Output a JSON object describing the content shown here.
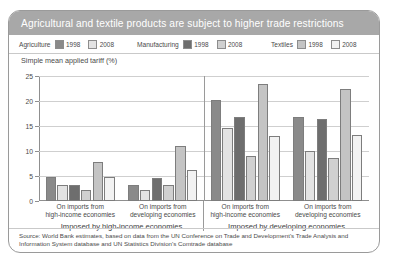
{
  "title": "Agricultural and textile products are subject to higher trade restrictions",
  "legend": [
    {
      "name": "Agriculture",
      "items": [
        {
          "label": "1998",
          "color": "#8a8a8a"
        },
        {
          "label": "2008",
          "color": "#e3e3e3"
        }
      ]
    },
    {
      "name": "Manufacturing",
      "items": [
        {
          "label": "1998",
          "color": "#6e6e6e"
        },
        {
          "label": "2008",
          "color": "#d0d0d0"
        }
      ]
    },
    {
      "name": "Textiles",
      "items": [
        {
          "label": "1998",
          "color": "#c4c4c4"
        },
        {
          "label": "2008",
          "color": "#f2f2f2"
        }
      ]
    }
  ],
  "axis_title": "Simple mean applied tariff (%)",
  "source": "Source: World Bank estimates, based on data from the UN Conference on Trade and Development's Trade Analysis and Information System database and UN Statistics Division's Comtrade database",
  "group_labels": [
    "Imposed by high-income economies",
    "Imposed by developing economies"
  ],
  "chart_data": {
    "type": "bar",
    "title": "Agricultural and textile products are subject to higher trade restrictions",
    "xlabel": "",
    "ylabel": "Simple mean applied tariff (%)",
    "ylim": [
      0,
      25
    ],
    "yticks": [
      0,
      5,
      10,
      15,
      20,
      25
    ],
    "grid": true,
    "legend_position": "top",
    "categories": [
      "On imports from high-income economies",
      "On imports from developing economies",
      "On imports from high-income economies",
      "On imports from developing economies"
    ],
    "category_lines": [
      [
        "On imports from",
        "high-income economies"
      ],
      [
        "On imports from",
        "developing economies"
      ],
      [
        "On imports from",
        "high-income economies"
      ],
      [
        "On imports from",
        "developing economies"
      ]
    ],
    "panels": [
      {
        "label": "Imposed by high-income economies",
        "categories": [
          0,
          1
        ]
      },
      {
        "label": "Imposed by developing economies",
        "categories": [
          2,
          3
        ]
      }
    ],
    "series": [
      {
        "name": "Agriculture 1998",
        "color": "#8a8a8a",
        "values": [
          4.8,
          3.3,
          20.3,
          16.8
        ]
      },
      {
        "name": "Agriculture 2008",
        "color": "#e3e3e3",
        "values": [
          3.2,
          2.3,
          14.6,
          10.0
        ]
      },
      {
        "name": "Manufacturing 1998",
        "color": "#6e6e6e",
        "values": [
          3.3,
          4.6,
          16.8,
          16.5
        ]
      },
      {
        "name": "Manufacturing 2008",
        "color": "#d0d0d0",
        "values": [
          2.3,
          3.2,
          9.0,
          8.7
        ]
      },
      {
        "name": "Textiles 1998",
        "color": "#c4c4c4",
        "values": [
          7.9,
          11.0,
          23.5,
          22.5
        ]
      },
      {
        "name": "Textiles 2008",
        "color": "#f2f2f2",
        "values": [
          4.8,
          6.3,
          13.0,
          13.3
        ]
      }
    ]
  }
}
